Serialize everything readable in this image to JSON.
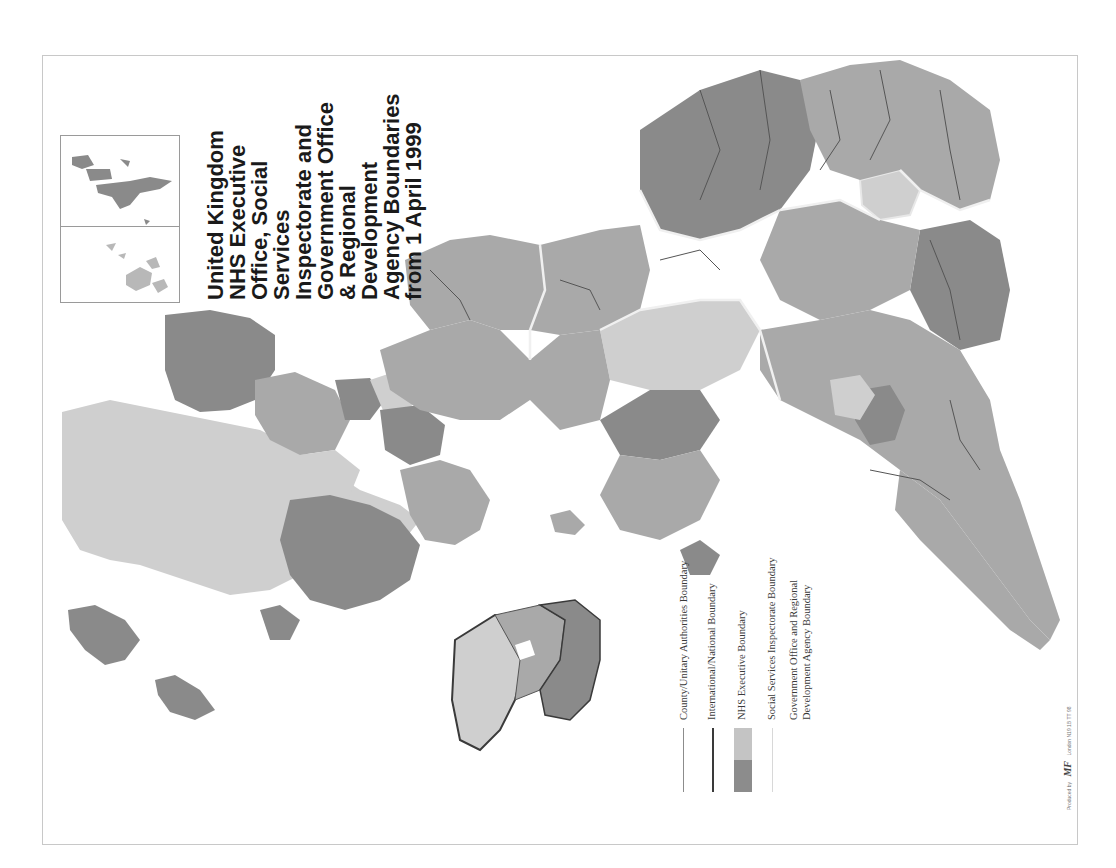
{
  "map": {
    "title_lines": [
      "United Kingdom",
      "NHS Executive",
      "Office, Social",
      "Services",
      "Inspectorate and",
      "Government Office",
      "& Regional",
      "Development",
      "Agency Boundaries",
      "from 1 April 1999"
    ],
    "orientation": "rotated 90 degrees counter-clockwise",
    "colors": {
      "light_grey": "#cfcfcf",
      "mid_grey": "#a9a9a9",
      "dark_grey": "#8a8a8a",
      "county_boundary": "#555555",
      "international_boundary": "#3a3a3a",
      "ssi_boundary": "#e8e8e8",
      "frame": "#c8c8c8"
    },
    "insets": {
      "shetland": "Shetland Islands inset",
      "orkney": "Orkney Islands inset"
    }
  },
  "legend": {
    "items": [
      {
        "label": "County/Unitary Authorities Boundary",
        "symbol": "thin-line",
        "color": "#8c8c8c"
      },
      {
        "label": "International/National Boundary",
        "symbol": "thick-line",
        "color": "#3a3a3a"
      },
      {
        "label": "NHS Executive Boundary",
        "symbol": "two-tone-swatch",
        "colors": [
          "#8c8c8c",
          "#c4c4c4"
        ]
      },
      {
        "label": "Social Services Inspectorate Boundary",
        "symbol": "white-line",
        "color": "#d8d8d8"
      },
      {
        "label_lines": [
          "Government Office and Regional",
          "Development Agency Boundary"
        ],
        "symbol": "none"
      }
    ]
  },
  "credit": {
    "prefix": "Produced by",
    "logo": "MF",
    "suffix": "London N19 1B TT 98"
  }
}
